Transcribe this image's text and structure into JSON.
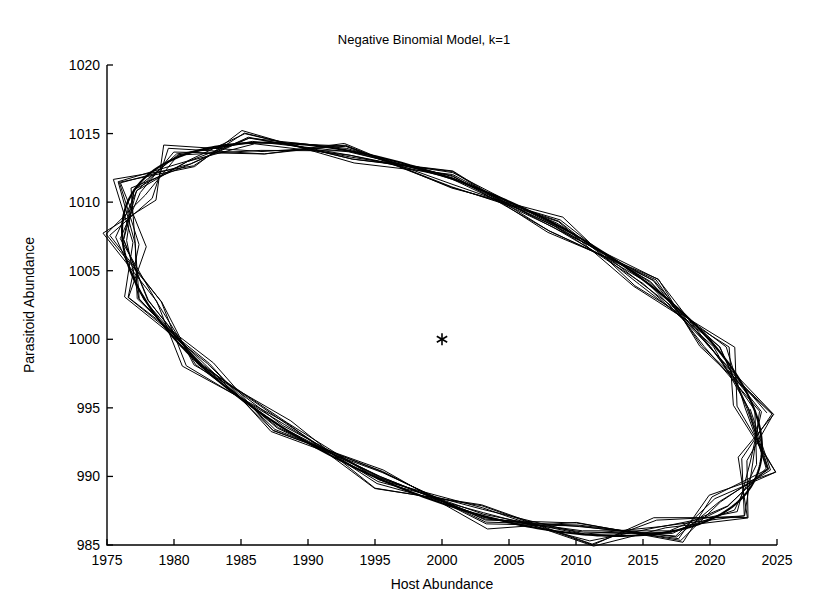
{
  "chart_data": {
    "type": "line",
    "title": "Negative Binomial Model, k=1",
    "xlabel": "Host Abundance",
    "ylabel": "Parasitoid Abundance",
    "xlim": [
      1975,
      2025
    ],
    "ylim": [
      985,
      1020
    ],
    "xticks": [
      1975,
      1980,
      1985,
      1990,
      1995,
      2000,
      2005,
      2010,
      2015,
      2020,
      2025
    ],
    "yticks": [
      985,
      990,
      995,
      1000,
      1005,
      1010,
      1015,
      1020
    ],
    "grid": false,
    "legend": null,
    "annotations": [
      {
        "name": "equilibrium-marker",
        "symbol": "asterisk",
        "x": 2000,
        "y": 1000,
        "label": ""
      }
    ],
    "series": [
      {
        "name": "limit-cycle",
        "kind": "closed-ellipse",
        "description": "Smooth invariant closed curve (neutrally stable limit cycle) of the host-parasitoid orbit",
        "ellipse": {
          "center_x": 2000,
          "center_y": 1000,
          "semi_major": 25.5,
          "semi_minor": 11.2,
          "rotation_deg": -23.0
        }
      },
      {
        "name": "orbit-trajectory",
        "kind": "discrete-zigzag-orbit",
        "description": "Successive iterates of the discrete-time negative binomial host-parasitoid model, connected by straight segments, winding around the invariant curve",
        "turns": 13,
        "points_per_turn": 19,
        "radial_jitter": 0.055,
        "ellipse": {
          "center_x": 2000,
          "center_y": 1000,
          "semi_major": 25.5,
          "semi_minor": 11.2,
          "rotation_deg": -23.0
        }
      }
    ],
    "extremes": {
      "host_min": 1979.0,
      "host_max": 2021.5,
      "parasitoid_min": 985.4,
      "parasitoid_max": 1015.0
    }
  },
  "figure": {
    "background_color": "#ffffff",
    "line_color": "#000000",
    "text_color": "#000000"
  }
}
